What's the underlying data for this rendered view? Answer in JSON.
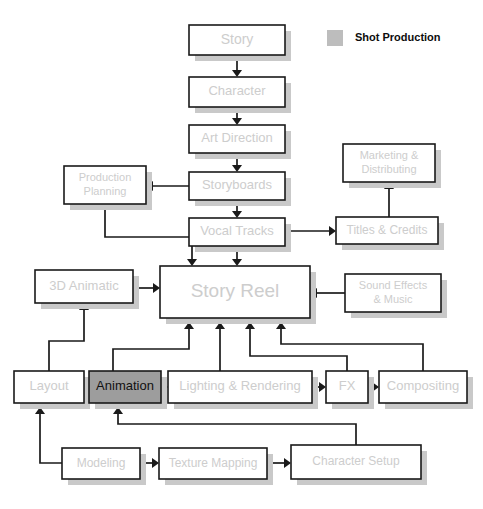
{
  "diagram": {
    "canvas": {
      "width": 483,
      "height": 509,
      "background": "#ffffff"
    },
    "style": {
      "box_fill": "#ffffff",
      "box_border": "#1a1a1a",
      "box_shadow": "#c9c9c9",
      "label_color": "#cdcdcd",
      "highlight_fill": "#9d9d9d",
      "highlight_label_color": "#111111",
      "edge_color": "#1a1a1a"
    },
    "legend": {
      "swatch_color": "#bdbdbd",
      "label": "Shot Production",
      "swatch": {
        "x": 327,
        "y": 30,
        "w": 16,
        "h": 16
      },
      "text_pos": {
        "x": 355,
        "y": 38
      }
    },
    "nodes": [
      {
        "id": "story",
        "label": "Story",
        "x": 189,
        "y": 25,
        "w": 96,
        "h": 30,
        "font_size": 14,
        "highlight": false,
        "lines": [
          "Story"
        ]
      },
      {
        "id": "character",
        "label": "Character",
        "x": 189,
        "y": 77,
        "w": 96,
        "h": 30,
        "font_size": 13,
        "highlight": false,
        "lines": [
          "Character"
        ]
      },
      {
        "id": "art-direction",
        "label": "Art Direction",
        "x": 189,
        "y": 125,
        "w": 96,
        "h": 28,
        "font_size": 13,
        "highlight": false,
        "lines": [
          "Art Direction"
        ]
      },
      {
        "id": "production-planning",
        "label": "Production Planning",
        "x": 64,
        "y": 166,
        "w": 82,
        "h": 38,
        "font_size": 11,
        "highlight": false,
        "lines": [
          "Production",
          "Planning"
        ]
      },
      {
        "id": "storyboards",
        "label": "Storyboards",
        "x": 189,
        "y": 172,
        "w": 96,
        "h": 28,
        "font_size": 13,
        "highlight": false,
        "lines": [
          "Storyboards"
        ]
      },
      {
        "id": "marketing-distributing",
        "label": "Marketing & Distributing",
        "x": 343,
        "y": 144,
        "w": 92,
        "h": 38,
        "font_size": 11,
        "highlight": false,
        "lines": [
          "Marketing &",
          "Distributing"
        ]
      },
      {
        "id": "vocal-tracks",
        "label": "Vocal Tracks",
        "x": 189,
        "y": 218,
        "w": 96,
        "h": 28,
        "font_size": 13,
        "highlight": false,
        "lines": [
          "Vocal Tracks"
        ]
      },
      {
        "id": "titles-credits",
        "label": "Titles & Credits",
        "x": 336,
        "y": 217,
        "w": 102,
        "h": 27,
        "font_size": 12,
        "highlight": false,
        "lines": [
          "Titles & Credits"
        ]
      },
      {
        "id": "3d-animatic",
        "label": "3D Animatic",
        "x": 35,
        "y": 270,
        "w": 98,
        "h": 33,
        "font_size": 13,
        "highlight": false,
        "lines": [
          "3D Animatic"
        ]
      },
      {
        "id": "story-reel",
        "label": "Story Reel",
        "x": 160,
        "y": 266,
        "w": 150,
        "h": 52,
        "font_size": 19,
        "highlight": false,
        "lines": [
          "Story Reel"
        ]
      },
      {
        "id": "sound-effects-music",
        "label": "Sound Effects & Music",
        "x": 345,
        "y": 274,
        "w": 96,
        "h": 38,
        "font_size": 11,
        "highlight": false,
        "lines": [
          "Sound Effects",
          "& Music"
        ]
      },
      {
        "id": "layout",
        "label": "Layout",
        "x": 14,
        "y": 371,
        "w": 70,
        "h": 32,
        "font_size": 13,
        "highlight": false,
        "lines": [
          "Layout"
        ]
      },
      {
        "id": "animation",
        "label": "Animation",
        "x": 89,
        "y": 371,
        "w": 72,
        "h": 32,
        "font_size": 13,
        "highlight": true,
        "lines": [
          "Animation"
        ]
      },
      {
        "id": "lighting-rendering",
        "label": "Lighting & Rendering",
        "x": 168,
        "y": 371,
        "w": 144,
        "h": 32,
        "font_size": 13,
        "highlight": false,
        "lines": [
          "Lighting & Rendering"
        ]
      },
      {
        "id": "fx",
        "label": "FX",
        "x": 326,
        "y": 371,
        "w": 42,
        "h": 32,
        "font_size": 13,
        "highlight": false,
        "lines": [
          "FX"
        ]
      },
      {
        "id": "compositing",
        "label": "Compositing",
        "x": 379,
        "y": 371,
        "w": 88,
        "h": 32,
        "font_size": 13,
        "highlight": false,
        "lines": [
          "Compositing"
        ]
      },
      {
        "id": "modeling",
        "label": "Modeling",
        "x": 62,
        "y": 448,
        "w": 78,
        "h": 31,
        "font_size": 12,
        "highlight": false,
        "lines": [
          "Modeling"
        ]
      },
      {
        "id": "texture-mapping",
        "label": "Texture Mapping",
        "x": 159,
        "y": 448,
        "w": 108,
        "h": 31,
        "font_size": 12,
        "highlight": false,
        "lines": [
          "Texture Mapping"
        ]
      },
      {
        "id": "character-setup",
        "label": "Character Setup",
        "x": 291,
        "y": 445,
        "w": 130,
        "h": 34,
        "font_size": 12,
        "highlight": false,
        "lines": [
          "Character Setup"
        ]
      }
    ],
    "edges": [
      {
        "from": "story",
        "to": "character",
        "path": "M237,55 L237,73",
        "arrow": "down",
        "ax": 237,
        "ay": 77
      },
      {
        "from": "character",
        "to": "art-direction",
        "path": "M237,107 L237,121",
        "arrow": "down",
        "ax": 237,
        "ay": 125
      },
      {
        "from": "art-direction",
        "to": "storyboards",
        "path": "M237,153 L237,168",
        "arrow": "down",
        "ax": 237,
        "ay": 172
      },
      {
        "from": "storyboards",
        "to": "production-planning",
        "path": "M189,186 L151,186",
        "arrow": "left",
        "ax": 146,
        "ay": 186
      },
      {
        "from": "storyboards",
        "to": "vocal-tracks",
        "path": "M237,200 L237,214",
        "arrow": "down",
        "ax": 237,
        "ay": 218
      },
      {
        "from": "production-planning",
        "to": "story-reel",
        "path": "M105,204 L105,237 L192,237 L192,262",
        "arrow": "down",
        "ax": 192,
        "ay": 266
      },
      {
        "from": "vocal-tracks",
        "to": "story-reel",
        "path": "M237,246 L237,262",
        "arrow": "down",
        "ax": 237,
        "ay": 266
      },
      {
        "from": "vocal-tracks",
        "to": "titles-credits",
        "path": "M285,231 L331,231",
        "arrow": "right",
        "ax": 336,
        "ay": 231
      },
      {
        "from": "titles-credits",
        "to": "marketing-distributing",
        "path": "M389,217 L389,187",
        "arrow": "up",
        "ax": 389,
        "ay": 182
      },
      {
        "from": "3d-animatic",
        "to": "story-reel",
        "path": "M133,288 L155,288",
        "arrow": "right",
        "ax": 160,
        "ay": 288
      },
      {
        "from": "sound-effects-music",
        "to": "story-reel",
        "path": "M345,293 L315,293",
        "arrow": "left",
        "ax": 310,
        "ay": 293
      },
      {
        "from": "layout",
        "to": "3d-animatic",
        "path": "M49,371 L49,341 L84,341 L84,308",
        "arrow": "up",
        "ax": 84,
        "ay": 303
      },
      {
        "from": "layout",
        "to": "animation",
        "path": "M84,387 L84,387",
        "arrow": "right",
        "ax": 89,
        "ay": 387
      },
      {
        "from": "animation",
        "to": "lighting-rendering",
        "path": "M161,387 L163,387",
        "arrow": "right",
        "ax": 168,
        "ay": 387
      },
      {
        "from": "lighting-rendering",
        "to": "fx",
        "path": "M312,387 L321,387",
        "arrow": "right",
        "ax": 326,
        "ay": 387
      },
      {
        "from": "fx",
        "to": "compositing",
        "path": "M368,387 L374,387",
        "arrow": "right",
        "ax": 379,
        "ay": 387
      },
      {
        "from": "animation",
        "to": "story-reel",
        "path": "M113,371 L113,349 L189,349 L189,326",
        "arrow": "up",
        "ax": 189,
        "ay": 322
      },
      {
        "from": "lighting-rendering",
        "to": "story-reel",
        "path": "M220,371 L220,326",
        "arrow": "up",
        "ax": 220,
        "ay": 322
      },
      {
        "from": "fx",
        "to": "story-reel",
        "path": "M347,371 L347,356 L250,356 L250,326",
        "arrow": "up",
        "ax": 250,
        "ay": 322
      },
      {
        "from": "compositing",
        "to": "story-reel",
        "path": "M423,371 L423,344 L281,344 L281,326",
        "arrow": "up",
        "ax": 281,
        "ay": 322
      },
      {
        "from": "modeling",
        "to": "layout",
        "path": "M62,463 L40,463 L40,411",
        "arrow": "up",
        "ax": 40,
        "ay": 407
      },
      {
        "from": "modeling",
        "to": "texture-mapping",
        "path": "M140,463 L154,463",
        "arrow": "right",
        "ax": 159,
        "ay": 463
      },
      {
        "from": "texture-mapping",
        "to": "character-setup",
        "path": "M267,463 L286,463",
        "arrow": "right",
        "ax": 291,
        "ay": 463
      },
      {
        "from": "character-setup",
        "to": "animation",
        "path": "M356,445 L356,424 L118,424 L118,411",
        "arrow": "up",
        "ax": 118,
        "ay": 407
      }
    ]
  }
}
